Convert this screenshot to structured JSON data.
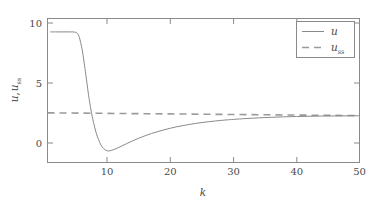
{
  "chart_data": {
    "type": "line",
    "title": "",
    "xlabel": "k",
    "ylabel": "u, u_ss",
    "ylabel_main": "u",
    "ylabel_second": "u",
    "ylabel_second_sub": "ss",
    "xlim": [
      0.5,
      50
    ],
    "ylim": [
      -1.7,
      11.2
    ],
    "xticks": [
      10,
      20,
      30,
      40,
      50
    ],
    "yticks": [
      0,
      5,
      10
    ],
    "grid": false,
    "legend_position": "top-right",
    "series": [
      {
        "name": "u",
        "style": "solid",
        "color": "#8a8a8a",
        "x": [
          1,
          2,
          3,
          4,
          5,
          5.5,
          6,
          6.3,
          6.6,
          7,
          7.4,
          7.8,
          8.2,
          8.6,
          9,
          9.4,
          10,
          10.6,
          11.2,
          12,
          13,
          14,
          15,
          16,
          17,
          18,
          19,
          20,
          21,
          22,
          23,
          24,
          25,
          26,
          27,
          28,
          29,
          30,
          32,
          34,
          36,
          38,
          40,
          42,
          44,
          46,
          48,
          50
        ],
        "y": [
          10,
          10,
          10,
          10,
          9.95,
          9.6,
          8.4,
          7.3,
          6.1,
          4.4,
          3.0,
          1.9,
          1.0,
          0.35,
          -0.15,
          -0.45,
          -0.66,
          -0.62,
          -0.5,
          -0.3,
          -0.02,
          0.24,
          0.48,
          0.7,
          0.9,
          1.07,
          1.23,
          1.37,
          1.5,
          1.61,
          1.71,
          1.8,
          1.88,
          1.95,
          2.01,
          2.07,
          2.12,
          2.16,
          2.24,
          2.3,
          2.35,
          2.39,
          2.42,
          2.44,
          2.46,
          2.47,
          2.48,
          2.49
        ]
      },
      {
        "name": "u_ss",
        "style": "dashed",
        "color": "#9a9a9a",
        "x": [
          0.5,
          50
        ],
        "y": [
          2.75,
          2.5
        ]
      }
    ],
    "legend": [
      {
        "label": "u",
        "sub": "",
        "style": "solid"
      },
      {
        "label": "u",
        "sub": "ss",
        "style": "dashed"
      }
    ]
  },
  "axis": {
    "xtick_labels": [
      "10",
      "20",
      "30",
      "40",
      "50"
    ],
    "ytick_labels": [
      "0",
      "5",
      "10"
    ],
    "x_title": "k"
  }
}
